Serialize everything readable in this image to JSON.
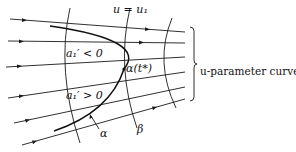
{
  "figure": {
    "labels": {
      "top_curve": "u = u₁",
      "region_upper": "a₁′ < 0",
      "region_lower": "a₁′ > 0",
      "point": "α(t*)",
      "curve_alpha": "α",
      "curve_beta": "β",
      "brace_label": "u-parameter curves"
    },
    "elements": {
      "u_parameter_curve_count": 6,
      "vertical_curve_count": 3,
      "brace": "right-brace"
    },
    "colors": {
      "ink": "#1a1a1a",
      "background": "#ffffff"
    }
  }
}
